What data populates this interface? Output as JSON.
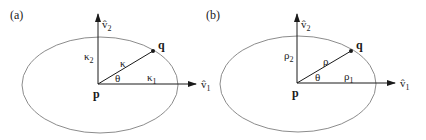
{
  "figure": {
    "panels": [
      {
        "id": "a",
        "panel_label": "(a)",
        "origin_label": "p",
        "point_label": "q",
        "axis_x_label": "v̂",
        "axis_x_sub": "1",
        "axis_y_label": "v̂",
        "axis_y_sub": "2",
        "radius_label": "κ",
        "radius_x_label": "κ",
        "radius_x_sub": "1",
        "radius_y_label": "κ",
        "radius_y_sub": "2",
        "angle_label": "θ"
      },
      {
        "id": "b",
        "panel_label": "(b)",
        "origin_label": "p",
        "point_label": "q",
        "axis_x_label": "v̂",
        "axis_x_sub": "1",
        "axis_y_label": "v̂",
        "axis_y_sub": "2",
        "radius_label": "ρ",
        "radius_x_label": "ρ",
        "radius_x_sub": "1",
        "radius_y_label": "ρ",
        "radius_y_sub": "2",
        "angle_label": "θ"
      }
    ],
    "colors": {
      "ellipse": "#8c8c8c",
      "axes": "#1a1a1a",
      "text": "#1a1a1a"
    }
  }
}
